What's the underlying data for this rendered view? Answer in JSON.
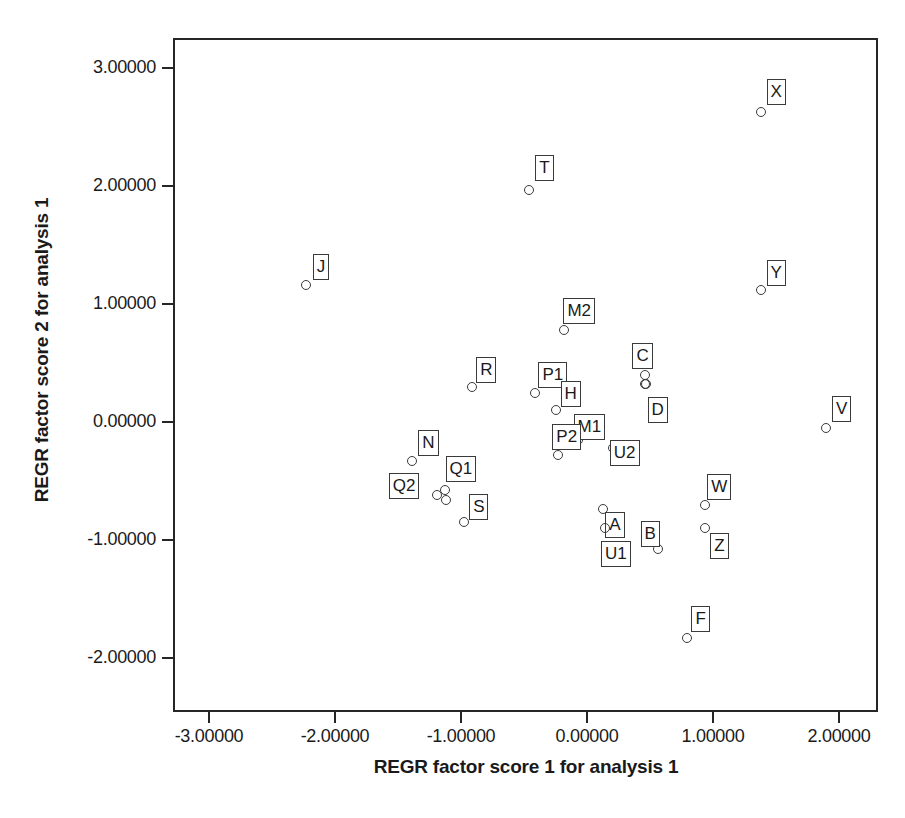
{
  "chart_data": {
    "type": "scatter",
    "title": "",
    "xlabel": "REGR factor score 1 for analysis 1",
    "ylabel": "REGR factor score 2 for analysis 1",
    "xlim": [
      -3.33,
      2.31
    ],
    "ylim": [
      -2.33,
      3.27
    ],
    "xticks": [
      -3,
      -2,
      -1,
      0,
      1,
      2
    ],
    "yticks": [
      -2,
      -1,
      0,
      1,
      2,
      3
    ],
    "xtick_labels": [
      "-3.00000",
      "-2.00000",
      "-1.00000",
      "0.00000",
      "1.00000",
      "2.00000"
    ],
    "ytick_labels": [
      "3.00000",
      "2.00000",
      "1.00000",
      "0.00000",
      "-1.00000",
      "-2.00000"
    ],
    "grid": false,
    "legend": "none",
    "marker": "open-circle",
    "point_color": "#3a3a3a",
    "points": [
      {
        "label": "X",
        "x": 1.38,
        "y": 2.63,
        "lx": 1.5,
        "ly": 2.8
      },
      {
        "label": "T",
        "x": -0.46,
        "y": 1.97,
        "ly": 2.15,
        "lx": -0.34
      },
      {
        "label": "J",
        "x": -2.23,
        "y": 1.16,
        "lx": -2.11,
        "ly": 1.31
      },
      {
        "label": "Y",
        "x": 1.38,
        "y": 1.12,
        "lx": 1.5,
        "ly": 1.26
      },
      {
        "label": "M2",
        "x": -0.18,
        "y": 0.78,
        "lx": -0.06,
        "ly": 0.94
      },
      {
        "label": "C",
        "x": 0.46,
        "y": 0.4,
        "lx": 0.44,
        "ly": 0.56
      },
      {
        "label": "R",
        "x": -0.91,
        "y": 0.3,
        "lx": -0.8,
        "ly": 0.44
      },
      {
        "label": "P1",
        "x": -0.41,
        "y": 0.25,
        "lx": -0.27,
        "ly": 0.4
      },
      {
        "label": "D",
        "x": 0.47,
        "y": 0.32,
        "lx": 0.56,
        "ly": 0.1
      },
      {
        "label": "H",
        "x": -0.25,
        "y": 0.1,
        "lx": -0.13,
        "ly": 0.24
      },
      {
        "label": "V",
        "x": 1.9,
        "y": -0.05,
        "lx": 2.02,
        "ly": 0.11
      },
      {
        "label": "M1",
        "x": -0.07,
        "y": -0.15,
        "lx": 0.02,
        "ly": -0.04
      },
      {
        "label": "P2",
        "x": -0.23,
        "y": -0.28,
        "lx": -0.16,
        "ly": -0.13
      },
      {
        "label": "U2",
        "x": 0.21,
        "y": -0.22,
        "lx": 0.3,
        "ly": -0.26
      },
      {
        "label": "N",
        "x": -1.39,
        "y": -0.33,
        "lx": -1.26,
        "ly": -0.18
      },
      {
        "label": "Q1",
        "x": -1.13,
        "y": -0.58,
        "lx": -1.0,
        "ly": -0.4
      },
      {
        "label": "Q2",
        "x": -1.19,
        "y": -0.62,
        "lx": -1.45,
        "ly": -0.54
      },
      {
        "label": "W",
        "x": 0.94,
        "y": -0.7,
        "lx": 1.05,
        "ly": -0.55
      },
      {
        "label": "A",
        "x": 0.13,
        "y": -0.74,
        "lx": 0.22,
        "ly": -0.87
      },
      {
        "label": "S",
        "x": -0.98,
        "y": -0.85,
        "lx": -0.86,
        "ly": -0.72
      },
      {
        "label": "Z",
        "x": 0.94,
        "y": -0.9,
        "lx": 1.05,
        "ly": -1.05
      },
      {
        "label": "U1",
        "x": 0.14,
        "y": -0.9,
        "lx": 0.23,
        "ly": -1.12
      },
      {
        "label": "B",
        "x": 0.56,
        "y": -1.08,
        "lx": 0.5,
        "ly": -0.95
      },
      {
        "label": "F",
        "x": 0.79,
        "y": -1.83,
        "lx": 0.9,
        "ly": -1.67
      }
    ],
    "extra_markers": [
      {
        "x": 0.46,
        "y": 0.32
      },
      {
        "x": -1.12,
        "y": -0.66
      }
    ]
  },
  "caption": ""
}
